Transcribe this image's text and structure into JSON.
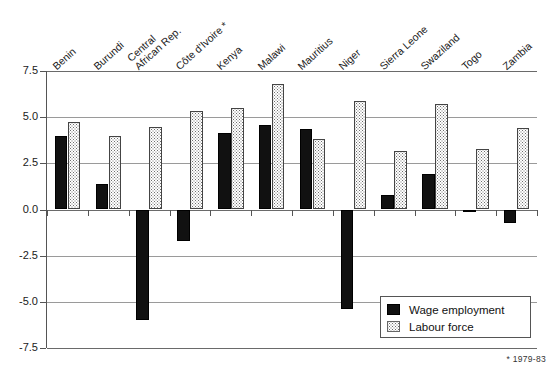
{
  "chart_data": {
    "type": "bar",
    "title": "",
    "xlabel": "",
    "ylabel": "",
    "ylim": [
      -7.5,
      7.5
    ],
    "ytick_values": [
      7.5,
      5.0,
      2.5,
      0.0,
      -2.5,
      -5.0,
      -7.5
    ],
    "ytick_labels": [
      "7.5",
      "5.0",
      "2.5",
      "0.0",
      "-2.5",
      "-5.0",
      "-7.5"
    ],
    "grid": true,
    "legend_position": "bottom-right",
    "categories": [
      "Benin",
      "Burundi",
      "Central African Rep.",
      "Côte d'Ivoire *",
      "Kenya",
      "Malawi",
      "Mauritius",
      "Niger",
      "Sierra Leone",
      "Swaziland",
      "Togo",
      "Zambia"
    ],
    "category_lines": [
      [
        "Benin"
      ],
      [
        "Burundi"
      ],
      [
        "Central",
        "African Rep."
      ],
      [
        "Côte d'Ivoire *"
      ],
      [
        "Kenya"
      ],
      [
        "Malawi"
      ],
      [
        "Mauritius"
      ],
      [
        "Niger"
      ],
      [
        "Sierra Leone"
      ],
      [
        "Swaziland"
      ],
      [
        "Togo"
      ],
      [
        "Zambia"
      ]
    ],
    "series": [
      {
        "name": "Wage employment",
        "color": "#111111",
        "values": [
          4.0,
          1.4,
          -6.0,
          -1.7,
          4.15,
          4.55,
          4.35,
          -5.4,
          0.8,
          1.9,
          0.0,
          -0.75
        ]
      },
      {
        "name": "Labour force",
        "color": "#dcdcdc",
        "values": [
          4.75,
          4.0,
          4.45,
          5.35,
          5.5,
          6.8,
          3.8,
          5.9,
          3.15,
          5.7,
          3.25,
          4.4
        ]
      }
    ]
  },
  "legend": {
    "entries": [
      {
        "label": "Wage employment",
        "swatch": "wage"
      },
      {
        "label": "Labour force",
        "swatch": "labour"
      }
    ]
  },
  "footnotes": {
    "right": "*  1979-83",
    "left": ""
  }
}
